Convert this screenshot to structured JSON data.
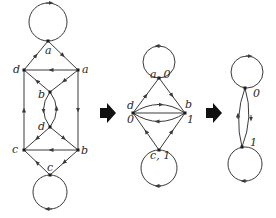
{
  "diagram": {
    "stages": [
      {
        "id": "original",
        "nodes": [
          {
            "label": "a",
            "pos": "top"
          },
          {
            "label": "d",
            "pos": "upper-left"
          },
          {
            "label": "a",
            "pos": "upper-right"
          },
          {
            "label": "b",
            "pos": "upper-center"
          },
          {
            "label": "d",
            "pos": "lower-center"
          },
          {
            "label": "c",
            "pos": "lower-left"
          },
          {
            "label": "b",
            "pos": "lower-right"
          },
          {
            "label": "c",
            "pos": "bottom"
          }
        ]
      },
      {
        "id": "reduced-1",
        "nodes": [
          {
            "label": "a, 0",
            "pos": "top"
          },
          {
            "label": "d",
            "sublabel": "0",
            "pos": "left"
          },
          {
            "label": "b",
            "sublabel": "1",
            "pos": "right"
          },
          {
            "label": "c, 1",
            "pos": "bottom"
          }
        ]
      },
      {
        "id": "reduced-2",
        "nodes": [
          {
            "label": "0",
            "pos": "top"
          },
          {
            "label": "1",
            "pos": "bottom"
          }
        ]
      }
    ],
    "arrows": [
      "right-arrow",
      "right-arrow"
    ],
    "colors": {
      "stroke": "#3a3a3a",
      "node": "#1a1a1a",
      "arrow": "#111111"
    }
  },
  "labels": {
    "g1_a_top": "a",
    "g1_d_left": "d",
    "g1_a_right": "a",
    "g1_b_mid": "b",
    "g1_d_mid": "d",
    "g1_c_left": "c",
    "g1_b_right": "b",
    "g1_c_bottom": "c",
    "g2_top": "a, 0",
    "g2_d": "d",
    "g2_d_sub": "0",
    "g2_b": "b",
    "g2_b_sub": "1",
    "g2_bottom": "c, 1",
    "g3_top": "0",
    "g3_bottom": "1"
  }
}
